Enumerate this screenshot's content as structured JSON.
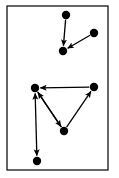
{
  "figure": {
    "width": 119,
    "height": 178,
    "background_color": "#ffffff",
    "ink_color": "#000000"
  },
  "frame": {
    "name": "figure-border",
    "x": 7,
    "y": 6,
    "width": 101,
    "height": 164,
    "stroke_color": "#000000",
    "stroke_width": 1.2,
    "fill": "none"
  },
  "chart_data": {
    "type": "diagram",
    "subtype": "directed-graph",
    "title": "",
    "xlabel": "",
    "ylabel": "",
    "grid": false,
    "legend": "none",
    "node_style": {
      "shape": "filled-circle",
      "radius": 4.2,
      "fill": "#000000",
      "stroke": "none"
    },
    "edge_style": {
      "stroke": "#000000",
      "stroke_width": 1.3,
      "arrowhead": "solid-triangle",
      "arrow_size": 5.5
    },
    "clusters": [
      {
        "name": "upper-cluster",
        "node_ids": [
          "n1",
          "n2",
          "n3"
        ]
      },
      {
        "name": "lower-cluster",
        "node_ids": [
          "n4",
          "n5",
          "n6",
          "n7"
        ]
      }
    ],
    "nodes": [
      {
        "id": "n1",
        "label": "",
        "x": 66,
        "y": 15,
        "cluster": "upper-cluster"
      },
      {
        "id": "n2",
        "label": "",
        "x": 63,
        "y": 51,
        "cluster": "upper-cluster"
      },
      {
        "id": "n3",
        "label": "",
        "x": 94,
        "y": 33,
        "cluster": "upper-cluster"
      },
      {
        "id": "n4",
        "label": "",
        "x": 35,
        "y": 88,
        "cluster": "lower-cluster"
      },
      {
        "id": "n5",
        "label": "",
        "x": 94,
        "y": 87,
        "cluster": "lower-cluster"
      },
      {
        "id": "n6",
        "label": "",
        "x": 64,
        "y": 131,
        "cluster": "lower-cluster"
      },
      {
        "id": "n7",
        "label": "",
        "x": 37,
        "y": 161,
        "cluster": "lower-cluster"
      }
    ],
    "edges": [
      {
        "id": "e1",
        "from": "n1",
        "to": "n2",
        "directed": true,
        "bidirectional": false,
        "label": ""
      },
      {
        "id": "e2",
        "from": "n3",
        "to": "n2",
        "directed": true,
        "bidirectional": false,
        "label": ""
      },
      {
        "id": "e3",
        "from": "n5",
        "to": "n4",
        "directed": true,
        "bidirectional": false,
        "label": ""
      },
      {
        "id": "e4",
        "from": "n6",
        "to": "n4",
        "directed": true,
        "bidirectional": false,
        "label": ""
      },
      {
        "id": "e5",
        "from": "n4",
        "to": "n6",
        "directed": true,
        "bidirectional": false,
        "label": ""
      },
      {
        "id": "e6",
        "from": "n6",
        "to": "n5",
        "directed": true,
        "bidirectional": false,
        "label": ""
      },
      {
        "id": "e7",
        "from": "n7",
        "to": "n4",
        "directed": true,
        "bidirectional": true,
        "label": ""
      }
    ],
    "counts": {
      "nodes": 7,
      "edges": 7,
      "clusters": 2
    }
  }
}
